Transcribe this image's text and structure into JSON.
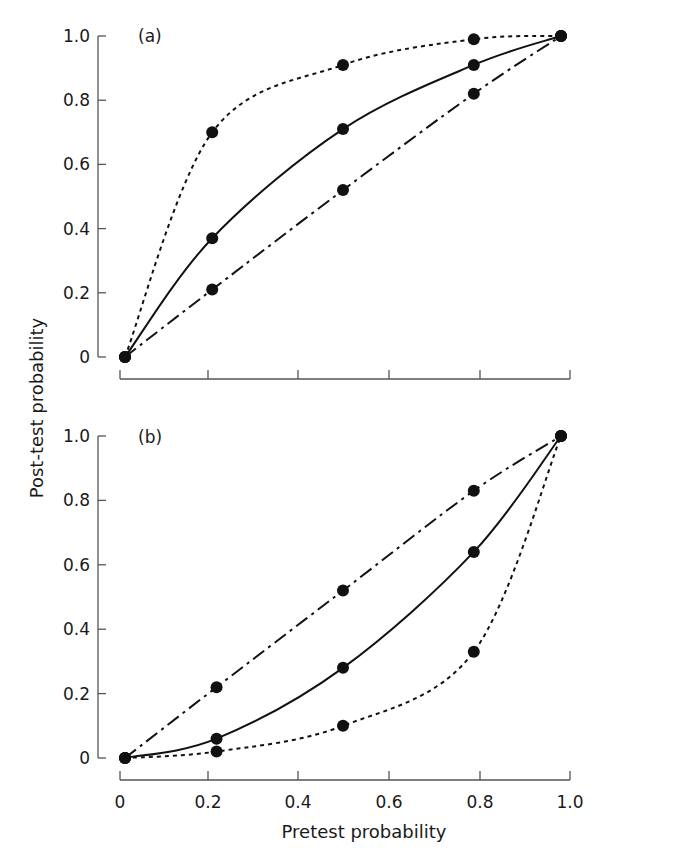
{
  "chart_data": [
    {
      "type": "line",
      "panel_label": "(a)",
      "title": "",
      "xlabel": "Pretest probability",
      "ylabel": "Post-test probability",
      "xlim": [
        0,
        1
      ],
      "ylim": [
        0,
        1
      ],
      "x_ticks": [
        "0",
        "0.2",
        "0.4",
        "0.6",
        "0.8",
        "1.0"
      ],
      "y_ticks": [
        "0",
        "0.2",
        "0.4",
        "0.6",
        "0.8",
        "1.0"
      ],
      "grid": false,
      "legend": null,
      "series": [
        {
          "name": "dotted",
          "style": "dotted",
          "x": [
            0,
            0.2,
            0.5,
            0.8,
            1.0
          ],
          "y": [
            0,
            0.7,
            0.91,
            0.99,
            1.0
          ]
        },
        {
          "name": "solid",
          "style": "solid",
          "x": [
            0,
            0.2,
            0.5,
            0.8,
            1.0
          ],
          "y": [
            0,
            0.37,
            0.71,
            0.91,
            1.0
          ]
        },
        {
          "name": "dash-dot",
          "style": "dashdot",
          "x": [
            0,
            0.2,
            0.5,
            0.8,
            1.0
          ],
          "y": [
            0,
            0.21,
            0.52,
            0.82,
            1.0
          ]
        }
      ]
    },
    {
      "type": "line",
      "panel_label": "(b)",
      "title": "",
      "xlabel": "Pretest probability",
      "ylabel": "Post-test probability",
      "xlim": [
        0,
        1
      ],
      "ylim": [
        0,
        1
      ],
      "x_ticks": [
        "0",
        "0.2",
        "0.4",
        "0.6",
        "0.8",
        "1.0"
      ],
      "y_ticks": [
        "0",
        "0.2",
        "0.4",
        "0.6",
        "0.8",
        "1.0"
      ],
      "grid": false,
      "legend": null,
      "series": [
        {
          "name": "dash-dot",
          "style": "dashdot",
          "x": [
            0,
            0.21,
            0.5,
            0.8,
            1.0
          ],
          "y": [
            0,
            0.22,
            0.52,
            0.83,
            1.0
          ]
        },
        {
          "name": "solid",
          "style": "solid",
          "x": [
            0,
            0.21,
            0.5,
            0.8,
            1.0
          ],
          "y": [
            0,
            0.06,
            0.28,
            0.64,
            1.0
          ]
        },
        {
          "name": "dotted",
          "style": "dotted",
          "x": [
            0,
            0.21,
            0.5,
            0.8,
            1.0
          ],
          "y": [
            0,
            0.02,
            0.1,
            0.33,
            1.0
          ]
        }
      ]
    }
  ],
  "labels": {
    "panel_a": "(a)",
    "panel_b": "(b)",
    "xlabel": "Pretest probability",
    "ylabel": "Post-test probability",
    "x_ticks": [
      "0",
      "0.2",
      "0.4",
      "0.6",
      "0.8",
      "1.0"
    ],
    "y_ticks": [
      "0",
      "0.2",
      "0.4",
      "0.6",
      "0.8",
      "1.0"
    ]
  }
}
